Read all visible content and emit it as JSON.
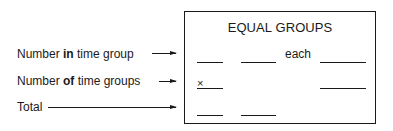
{
  "labels": {
    "row1": {
      "pre": "Number ",
      "bold": "in",
      "post": " time group"
    },
    "row2": {
      "pre": "Number ",
      "bold": "of",
      "post": " time groups"
    },
    "row3": {
      "pre": "Total",
      "bold": "",
      "post": ""
    }
  },
  "box": {
    "title": "EQUAL GROUPS",
    "each_label": "each",
    "times_symbol": "×"
  }
}
